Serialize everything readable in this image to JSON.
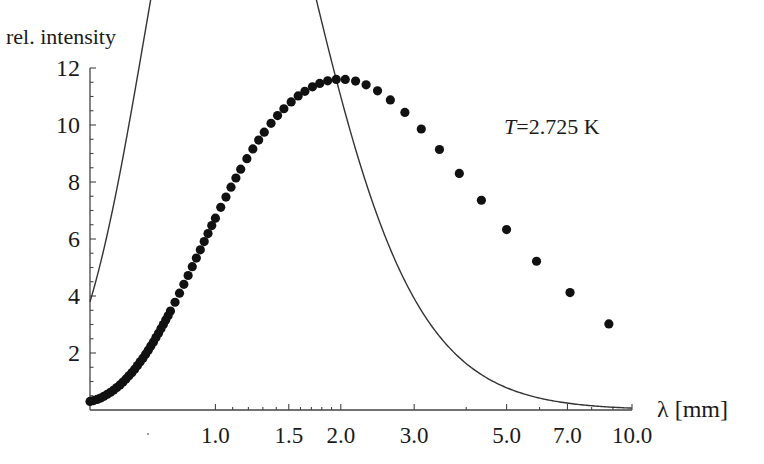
{
  "chart_data": {
    "type": "scatter",
    "title": "",
    "ylabel": "rel. intensity",
    "xlabel": "λ [mm]",
    "annotation": {
      "text_italic": "T",
      "text": "=2.725 K"
    },
    "x_scale": "log",
    "xlim": [
      0.5,
      10.0
    ],
    "ylim": [
      0,
      12
    ],
    "x_ticks": [
      {
        "value": 1.0,
        "label": "1.0"
      },
      {
        "value": 1.5,
        "label": "1.5"
      },
      {
        "value": 2.0,
        "label": "2.0"
      },
      {
        "value": 3.0,
        "label": "3.0"
      },
      {
        "value": 5.0,
        "label": "5.0"
      },
      {
        "value": 7.0,
        "label": "7.0"
      },
      {
        "value": 10.0,
        "label": "10.0"
      }
    ],
    "x_minor_ticks": [
      1.1,
      1.2,
      1.3,
      1.4,
      1.6,
      1.7,
      1.8,
      1.9,
      4.0,
      6.0,
      8.0,
      9.0
    ],
    "y_ticks": [
      {
        "value": 2,
        "label": "2"
      },
      {
        "value": 4,
        "label": "4"
      },
      {
        "value": 6,
        "label": "6"
      },
      {
        "value": 8,
        "label": "8"
      },
      {
        "value": 10,
        "label": "10"
      },
      {
        "value": 12,
        "label": "12"
      }
    ],
    "y_minor_step": 0.5,
    "grid": false,
    "legend": null,
    "series": [
      {
        "name": "measured",
        "style": "markers",
        "color": "#111111",
        "x": [
          0.5,
          0.51,
          0.52,
          0.53,
          0.54,
          0.55,
          0.56,
          0.57,
          0.58,
          0.59,
          0.6,
          0.61,
          0.62,
          0.63,
          0.64,
          0.65,
          0.66,
          0.67,
          0.68,
          0.69,
          0.7,
          0.71,
          0.72,
          0.73,
          0.74,
          0.75,
          0.76,
          0.77,
          0.78,
          0.8,
          0.82,
          0.84,
          0.86,
          0.88,
          0.9,
          0.92,
          0.94,
          0.96,
          0.98,
          1.0,
          1.03,
          1.06,
          1.09,
          1.12,
          1.15,
          1.19,
          1.23,
          1.27,
          1.31,
          1.36,
          1.41,
          1.46,
          1.52,
          1.58,
          1.64,
          1.71,
          1.78,
          1.86,
          1.95,
          2.05,
          2.17,
          2.3,
          2.45,
          2.63,
          2.85,
          3.12,
          3.45,
          3.85,
          4.35,
          5.0,
          5.9,
          7.1,
          8.8
        ],
        "y": [
          0.3,
          0.33,
          0.37,
          0.42,
          0.48,
          0.55,
          0.62,
          0.7,
          0.79,
          0.88,
          0.98,
          1.09,
          1.2,
          1.31,
          1.43,
          1.56,
          1.69,
          1.82,
          1.96,
          2.1,
          2.25,
          2.39,
          2.54,
          2.69,
          2.85,
          3.0,
          3.16,
          3.31,
          3.47,
          3.78,
          4.1,
          4.41,
          4.72,
          5.03,
          5.33,
          5.62,
          5.91,
          6.19,
          6.47,
          6.73,
          7.11,
          7.47,
          7.82,
          8.14,
          8.45,
          8.82,
          9.16,
          9.47,
          9.75,
          10.06,
          10.33,
          10.57,
          10.81,
          11.02,
          11.18,
          11.34,
          11.46,
          11.55,
          11.6,
          11.6,
          11.54,
          11.41,
          11.2,
          10.88,
          10.44,
          9.86,
          9.14,
          8.3,
          7.36,
          6.33,
          5.22,
          4.12,
          3.02
        ]
      },
      {
        "name": "Planck fit (T=2.725 K)",
        "style": "line",
        "color": "#333333",
        "x_range": [
          0.5,
          10.0
        ],
        "peak": {
          "x": 1.95,
          "y": 11.6
        },
        "end_value": {
          "x": 10.0,
          "y": 1.8
        }
      }
    ]
  }
}
